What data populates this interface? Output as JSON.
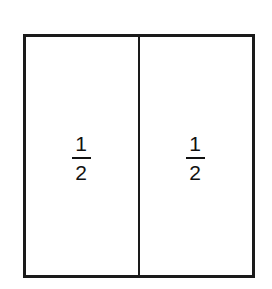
{
  "diagram": {
    "title": "",
    "shape": "rectangle divided into two equal parts",
    "parts": [
      {
        "numerator": "1",
        "denominator": "2"
      },
      {
        "numerator": "1",
        "denominator": "2"
      }
    ],
    "colors": {
      "stroke": "#1a1a1a",
      "fill": "#ffffff"
    }
  }
}
